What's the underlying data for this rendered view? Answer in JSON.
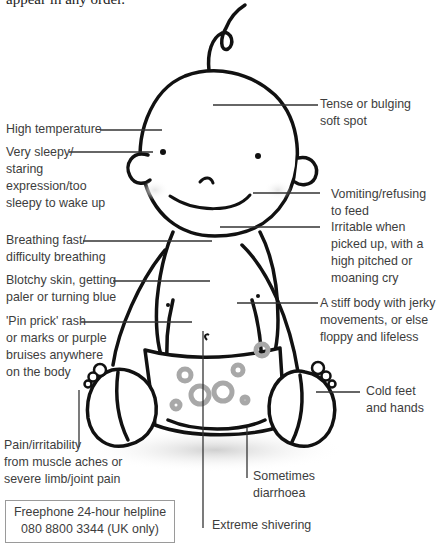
{
  "intro_text": "appear in any order.",
  "symptoms": {
    "soft_spot": [
      "Tense or bulging",
      "soft spot"
    ],
    "high_temperature": [
      "High temperature"
    ],
    "very_sleepy": [
      "Very sleepy/",
      "staring",
      "expression/too",
      "sleepy to wake up"
    ],
    "vomiting": [
      "Vomiting/refusing",
      "to feed"
    ],
    "breathing": [
      "Breathing fast/",
      "difficulty breathing"
    ],
    "irritable": [
      "Irritable when",
      "picked up, with a",
      "high pitched or",
      "moaning cry"
    ],
    "blotchy_skin": [
      "Blotchy skin, getting",
      "paler or turning blue"
    ],
    "stiff_body": [
      "A stiff body with jerky",
      "movements, or else",
      "floppy and lifeless"
    ],
    "pin_prick": [
      "'Pin prick' rash",
      "or marks or purple",
      "bruises anywhere",
      "on the body"
    ],
    "cold_feet": [
      "Cold feet",
      "and hands"
    ],
    "pain": [
      "Pain/irritability",
      "from muscle aches or",
      "severe limb/joint pain"
    ],
    "diarrhoea": [
      "Sometimes",
      "diarrhoea"
    ],
    "shivering": [
      "Extreme shivering"
    ]
  },
  "helpline": {
    "line1": "Freephone 24-hour helpline",
    "line2": "080 8800 3344 (UK only)"
  },
  "colors": {
    "outline": "#111111",
    "leader_line": "#333333",
    "text": "#3d3d3d",
    "diaper_spots": "#a8a8a8"
  }
}
